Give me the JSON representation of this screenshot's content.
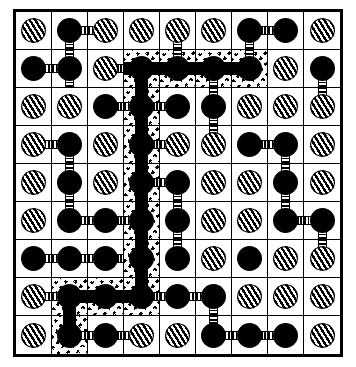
{
  "figure": {
    "name": "maze-lattice-diagram",
    "title": "Percolation lattice with highlighted connected path",
    "grid_rows": 9,
    "grid_cols": 9,
    "colors": {
      "ink": "#000000",
      "paper": "#ffffff",
      "highlight_texture": "#000000"
    },
    "legend": {
      "solid_node": "solid-black-circle",
      "hatched_node": "diagonally-hatched-circle",
      "thin_bond": "striped-connector",
      "path_bond": "solid-black-connector",
      "highlight_cell": "speckled-texture-cell"
    }
  },
  "cells": [
    [
      {
        "dot": "hatch",
        "bonds": [],
        "hl": false
      },
      {
        "dot": "solid",
        "bonds": [
          "right",
          "down"
        ],
        "hl": false
      },
      {
        "dot": "hatch",
        "bonds": [
          "left"
        ],
        "hl": false
      },
      {
        "dot": "hatch",
        "bonds": [],
        "hl": false
      },
      {
        "dot": "hatch",
        "bonds": [
          "down"
        ],
        "hl": false
      },
      {
        "dot": "hatch",
        "bonds": [],
        "hl": false
      },
      {
        "dot": "solid",
        "bonds": [
          "right",
          "down"
        ],
        "hl": false
      },
      {
        "dot": "solid",
        "bonds": [
          "left"
        ],
        "hl": false
      },
      {
        "dot": "hatch",
        "bonds": [],
        "hl": false
      }
    ],
    [
      {
        "dot": "solid",
        "bonds": [
          "right"
        ],
        "hl": false
      },
      {
        "dot": "solid",
        "bonds": [
          "left",
          "up",
          "down"
        ],
        "hl": false
      },
      {
        "dot": "hatch",
        "bonds": [
          "right"
        ],
        "hl": false
      },
      {
        "dot": "solid",
        "bonds": [
          "left-solid",
          "right-solid",
          "down-solid"
        ],
        "hl": true
      },
      {
        "dot": "solid",
        "bonds": [
          "left-solid",
          "right-solid",
          "up"
        ],
        "hl": true
      },
      {
        "dot": "solid",
        "bonds": [
          "left-solid",
          "right-solid",
          "down"
        ],
        "hl": true
      },
      {
        "dot": "solid",
        "bonds": [
          "left-solid",
          "up"
        ],
        "hl": true
      },
      {
        "dot": "hatch",
        "bonds": [],
        "hl": false
      },
      {
        "dot": "solid",
        "bonds": [
          "down"
        ],
        "hl": false
      }
    ],
    [
      {
        "dot": "hatch",
        "bonds": [],
        "hl": false
      },
      {
        "dot": "hatch",
        "bonds": [],
        "hl": false
      },
      {
        "dot": "solid",
        "bonds": [
          "right"
        ],
        "hl": false
      },
      {
        "dot": "solid",
        "bonds": [
          "left",
          "right",
          "up-solid",
          "down-solid"
        ],
        "hl": true
      },
      {
        "dot": "solid",
        "bonds": [
          "left"
        ],
        "hl": false
      },
      {
        "dot": "solid",
        "bonds": [
          "up",
          "down"
        ],
        "hl": false
      },
      {
        "dot": "hatch",
        "bonds": [],
        "hl": false
      },
      {
        "dot": "hatch",
        "bonds": [],
        "hl": false
      },
      {
        "dot": "hatch",
        "bonds": [
          "up"
        ],
        "hl": false
      }
    ],
    [
      {
        "dot": "hatch",
        "bonds": [
          "right"
        ],
        "hl": false
      },
      {
        "dot": "solid",
        "bonds": [
          "left",
          "down"
        ],
        "hl": false
      },
      {
        "dot": "hatch",
        "bonds": [],
        "hl": false
      },
      {
        "dot": "solid",
        "bonds": [
          "right",
          "up-solid",
          "down-solid"
        ],
        "hl": true
      },
      {
        "dot": "hatch",
        "bonds": [
          "left"
        ],
        "hl": false
      },
      {
        "dot": "hatch",
        "bonds": [
          "up"
        ],
        "hl": false
      },
      {
        "dot": "solid",
        "bonds": [
          "right"
        ],
        "hl": false
      },
      {
        "dot": "solid",
        "bonds": [
          "left",
          "down"
        ],
        "hl": false
      },
      {
        "dot": "hatch",
        "bonds": [],
        "hl": false
      }
    ],
    [
      {
        "dot": "hatch",
        "bonds": [],
        "hl": false
      },
      {
        "dot": "solid",
        "bonds": [
          "up",
          "down"
        ],
        "hl": false
      },
      {
        "dot": "hatch",
        "bonds": [],
        "hl": false
      },
      {
        "dot": "solid",
        "bonds": [
          "right",
          "up-solid",
          "down-solid"
        ],
        "hl": true
      },
      {
        "dot": "solid",
        "bonds": [
          "left",
          "down"
        ],
        "hl": false
      },
      {
        "dot": "hatch",
        "bonds": [],
        "hl": false
      },
      {
        "dot": "hatch",
        "bonds": [],
        "hl": false
      },
      {
        "dot": "solid",
        "bonds": [
          "up",
          "down"
        ],
        "hl": false
      },
      {
        "dot": "hatch",
        "bonds": [],
        "hl": false
      }
    ],
    [
      {
        "dot": "hatch",
        "bonds": [],
        "hl": false
      },
      {
        "dot": "solid",
        "bonds": [
          "up",
          "right"
        ],
        "hl": false
      },
      {
        "dot": "solid",
        "bonds": [
          "left",
          "right"
        ],
        "hl": false
      },
      {
        "dot": "solid",
        "bonds": [
          "left",
          "up-solid",
          "down-solid"
        ],
        "hl": true
      },
      {
        "dot": "solid",
        "bonds": [
          "up",
          "down"
        ],
        "hl": false
      },
      {
        "dot": "hatch",
        "bonds": [],
        "hl": false
      },
      {
        "dot": "hatch",
        "bonds": [],
        "hl": false
      },
      {
        "dot": "solid",
        "bonds": [
          "up",
          "right"
        ],
        "hl": false
      },
      {
        "dot": "solid",
        "bonds": [
          "left",
          "down"
        ],
        "hl": false
      }
    ],
    [
      {
        "dot": "solid",
        "bonds": [
          "right"
        ],
        "hl": false
      },
      {
        "dot": "solid",
        "bonds": [
          "left",
          "right"
        ],
        "hl": false
      },
      {
        "dot": "solid",
        "bonds": [
          "left",
          "right"
        ],
        "hl": false
      },
      {
        "dot": "solid",
        "bonds": [
          "up-solid",
          "down-solid"
        ],
        "hl": true
      },
      {
        "dot": "solid",
        "bonds": [
          "up"
        ],
        "hl": false
      },
      {
        "dot": "hatch",
        "bonds": [],
        "hl": false
      },
      {
        "dot": "solid",
        "bonds": [],
        "hl": false
      },
      {
        "dot": "hatch",
        "bonds": [],
        "hl": false
      },
      {
        "dot": "hatch",
        "bonds": [
          "up"
        ],
        "hl": false
      }
    ],
    [
      {
        "dot": "hatch",
        "bonds": [
          "right"
        ],
        "hl": false
      },
      {
        "dot": "solid",
        "bonds": [
          "left",
          "right-solid",
          "down-solid"
        ],
        "hl": true
      },
      {
        "dot": "solid",
        "bonds": [
          "left-solid",
          "right-solid"
        ],
        "hl": true
      },
      {
        "dot": "solid",
        "bonds": [
          "left-solid",
          "right",
          "up-solid"
        ],
        "hl": true
      },
      {
        "dot": "solid",
        "bonds": [
          "left",
          "right"
        ],
        "hl": false
      },
      {
        "dot": "solid",
        "bonds": [
          "left",
          "down"
        ],
        "hl": false
      },
      {
        "dot": "hatch",
        "bonds": [],
        "hl": false
      },
      {
        "dot": "hatch",
        "bonds": [],
        "hl": false
      },
      {
        "dot": "hatch",
        "bonds": [],
        "hl": false
      }
    ],
    [
      {
        "dot": "hatch",
        "bonds": [],
        "hl": false
      },
      {
        "dot": "solid",
        "bonds": [
          "up-solid",
          "right"
        ],
        "hl": true
      },
      {
        "dot": "solid",
        "bonds": [
          "left",
          "right"
        ],
        "hl": false
      },
      {
        "dot": "hatch",
        "bonds": [
          "left"
        ],
        "hl": false
      },
      {
        "dot": "hatch",
        "bonds": [],
        "hl": false
      },
      {
        "dot": "solid",
        "bonds": [
          "up",
          "right"
        ],
        "hl": false
      },
      {
        "dot": "solid",
        "bonds": [
          "left",
          "right"
        ],
        "hl": false
      },
      {
        "dot": "solid",
        "bonds": [
          "left"
        ],
        "hl": false
      },
      {
        "dot": "hatch",
        "bonds": [],
        "hl": false
      }
    ]
  ]
}
